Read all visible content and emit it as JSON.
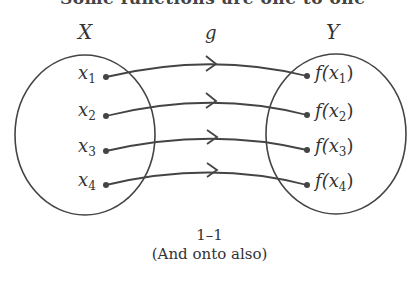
{
  "top_text": "Some functions are one to one",
  "diagram": {
    "domain_label": "X",
    "codomain_label": "Y",
    "function_label": "g",
    "domain_elements": [
      {
        "base": "x",
        "sub": "1"
      },
      {
        "base": "x",
        "sub": "2"
      },
      {
        "base": "x",
        "sub": "3"
      },
      {
        "base": "x",
        "sub": "4"
      }
    ],
    "codomain_elements": [
      {
        "pre": "f(x",
        "sub": "1",
        "post": ")"
      },
      {
        "pre": "f(x",
        "sub": "2",
        "post": ")"
      },
      {
        "pre": "f(x",
        "sub": "3",
        "post": ")"
      },
      {
        "pre": "f(x",
        "sub": "4",
        "post": ")"
      }
    ],
    "mappings": [
      {
        "from": "x1",
        "to": "f(x1)"
      },
      {
        "from": "x2",
        "to": "f(x2)"
      },
      {
        "from": "x3",
        "to": "f(x3)"
      },
      {
        "from": "x4",
        "to": "f(x4)"
      }
    ]
  },
  "caption": {
    "line1": "1–1",
    "line2": "(And onto also)"
  }
}
